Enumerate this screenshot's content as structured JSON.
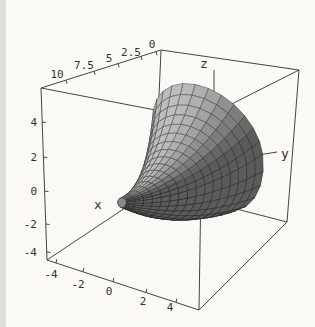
{
  "figure": {
    "title": "",
    "style": "Mathematica-style boxed 3D surface plot, scanned grayscale",
    "background": "#faf9f6",
    "line_color": "#46443f",
    "text_color": "#34322d"
  },
  "chart_data": {
    "type": "surface3d",
    "projection": "boxed axonometric 3D view, viewpoint above front-left",
    "grid": false,
    "legend": null,
    "box_ranges": {
      "x": [
        0,
        10
      ],
      "y": [
        -4,
        4
      ],
      "z": [
        -4,
        4
      ]
    },
    "axes": {
      "x": {
        "label": "x",
        "ticks": [
          10,
          7.5,
          5,
          2.5,
          0
        ],
        "tick_labels": [
          "10",
          "7.5",
          "5",
          "2.5",
          "0"
        ],
        "edge": "top-left box edge, values decreasing toward the back"
      },
      "y": {
        "label": "y",
        "ticks": [
          -4,
          -2,
          0,
          2,
          4
        ],
        "tick_labels": [
          "-4",
          "-2",
          "0",
          "2",
          "4"
        ],
        "edge": "bottom-front box edge"
      },
      "z": {
        "label": "z",
        "ticks": [
          4,
          2,
          0,
          -2,
          -4
        ],
        "tick_labels": [
          "4",
          "2",
          "0",
          "-2",
          "-4"
        ],
        "edge": "left vertical box edge"
      }
    },
    "surface": {
      "kind": "surface_of_revolution",
      "description": "Horn / trumpet-shaped surface revolved about the x-axis: narrow closed tip at the front-left (x near 10) flaring exponentially into a wide rounded bell mouth (radius about 3.5) at the back-right (x = 0)",
      "radius_profile": "r(x) = 3.5*exp(-x/2.5)",
      "mesh": {
        "rings": 16,
        "sectors": 26
      },
      "shading": "flat gray Lambert shading, light from upper left",
      "fill_gray_range": [
        "#585858",
        "#c0c0c0"
      ],
      "mesh_line_color": "#2e2e2e"
    }
  }
}
